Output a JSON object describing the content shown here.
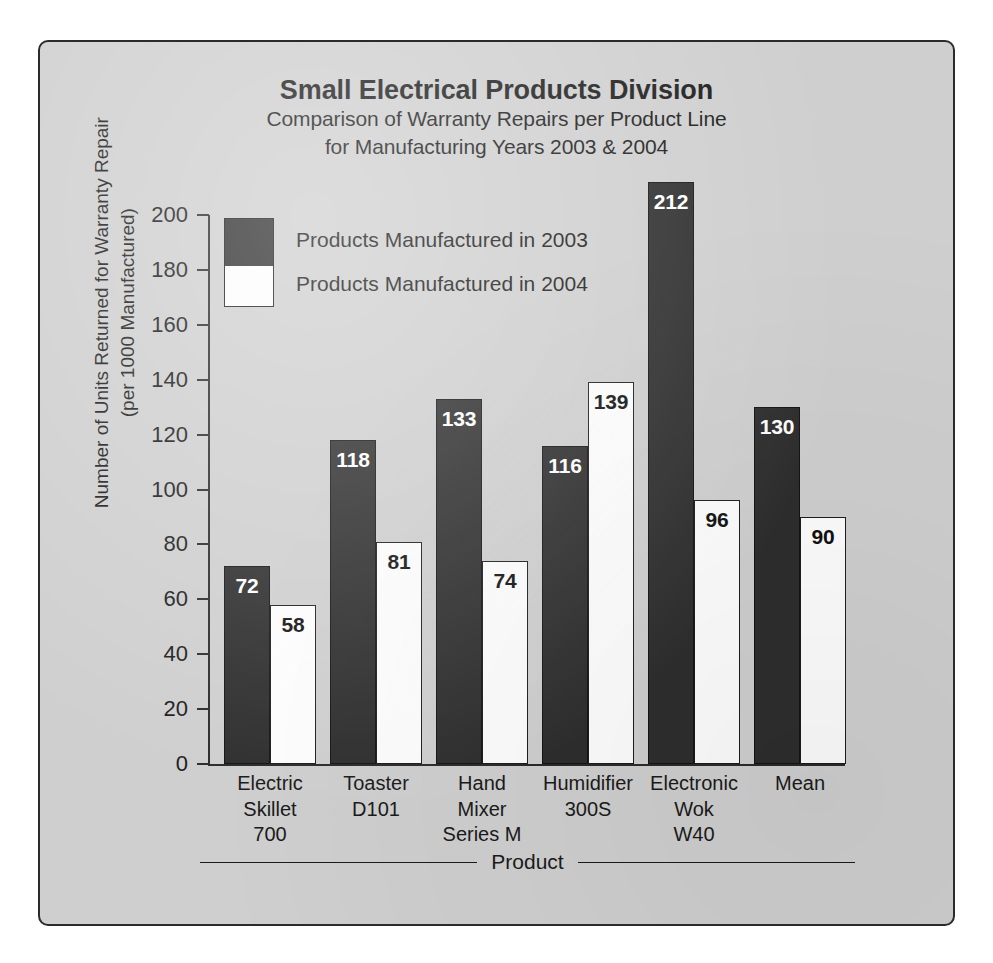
{
  "chart_data": {
    "type": "bar",
    "title": "Small Electrical Products Division",
    "subtitle_line1": "Comparison of Warranty Repairs per Product Line",
    "subtitle_line2": "for Manufacturing Years 2003 & 2004",
    "xlabel": "Product",
    "ylabel_line1": "Number of Units Returned for Warranty Repair",
    "ylabel_line2": "(per 1000 Manufactured)",
    "ylim": [
      0,
      200
    ],
    "ytick_step": 20,
    "yticks": [
      200,
      180,
      160,
      140,
      120,
      100,
      80,
      60,
      40,
      20,
      0
    ],
    "grid": false,
    "legend_position": "inside-top-left",
    "categories": [
      "Electric\nSkillet\n700",
      "Toaster\nD101",
      "Hand\nMixer\nSeries M",
      "Humidifier\n300S",
      "Electronic\nWok\nW40",
      "Mean"
    ],
    "category_lines": [
      [
        "Electric",
        "Skillet",
        "700"
      ],
      [
        "Toaster",
        "D101"
      ],
      [
        "Hand",
        "Mixer",
        "Series M"
      ],
      [
        "Humidifier",
        "300S"
      ],
      [
        "Electronic",
        "Wok",
        "W40"
      ],
      [
        "Mean"
      ]
    ],
    "series": [
      {
        "name": "Products Manufactured in 2003",
        "color": "#2e2e2e",
        "values": [
          72,
          118,
          133,
          116,
          212,
          130
        ]
      },
      {
        "name": "Products Manufactured in 2004",
        "color": "#fdfdfd",
        "values": [
          58,
          81,
          74,
          139,
          96,
          90
        ]
      }
    ]
  },
  "panel": {
    "background_color": "#cfcfcf",
    "border_color": "#2b2b2b"
  }
}
